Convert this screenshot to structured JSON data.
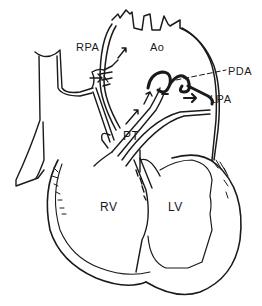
{
  "diagram": {
    "type": "anatomical-line-drawing",
    "colors": {
      "ink": "#1a1a1a",
      "background": "#ffffff"
    },
    "labels": [
      {
        "id": "rpa",
        "text": "RPA",
        "x": 76,
        "y": 42
      },
      {
        "id": "ao",
        "text": "Ao",
        "x": 150,
        "y": 42
      },
      {
        "id": "pda",
        "text": "PDA",
        "x": 228,
        "y": 66
      },
      {
        "id": "lpa",
        "text": "LPA",
        "x": 210,
        "y": 94
      },
      {
        "id": "pt",
        "text": "PT",
        "x": 123,
        "y": 130
      },
      {
        "id": "rv",
        "text": "RV",
        "x": 100,
        "y": 201
      },
      {
        "id": "lv",
        "text": "LV",
        "x": 168,
        "y": 201
      }
    ]
  }
}
